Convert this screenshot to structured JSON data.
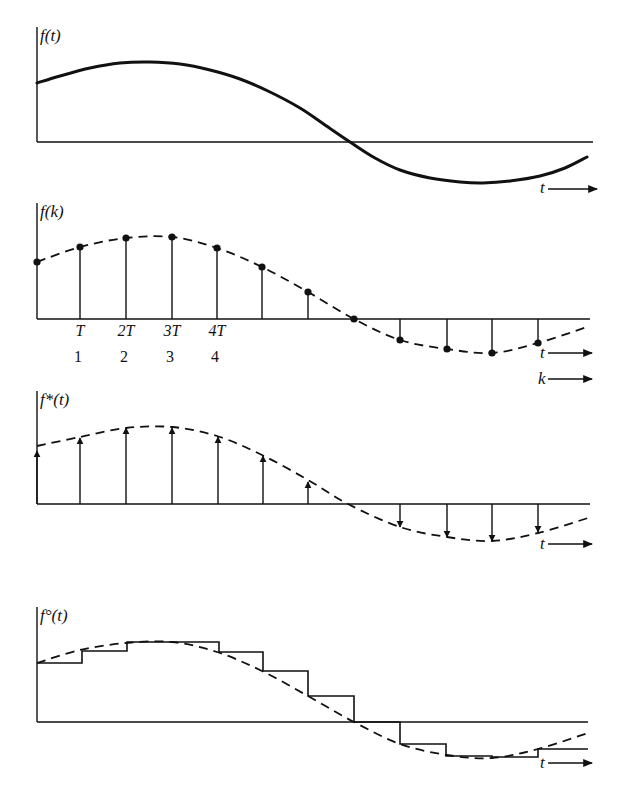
{
  "figure": {
    "ink_color": "#111111",
    "background": "#ffffff",
    "panels": [
      {
        "id": "continuous",
        "ylabel": "f(t)",
        "xlabel": "t",
        "curve_style": "solid",
        "axis": {
          "x0": 37,
          "top": 27,
          "baseline": 142,
          "x_end": 593
        },
        "curve_points": [
          [
            37,
            83
          ],
          [
            60,
            76
          ],
          [
            90,
            68
          ],
          [
            120,
            63
          ],
          [
            150,
            62
          ],
          [
            180,
            64
          ],
          [
            210,
            70
          ],
          [
            240,
            79
          ],
          [
            270,
            92
          ],
          [
            300,
            108
          ],
          [
            325,
            125
          ],
          [
            350,
            142
          ],
          [
            375,
            158
          ],
          [
            400,
            170
          ],
          [
            430,
            178
          ],
          [
            460,
            182
          ],
          [
            483,
            183
          ],
          [
            510,
            181
          ],
          [
            540,
            176
          ],
          [
            565,
            168
          ],
          [
            587,
            157
          ]
        ],
        "x_arrow": {
          "label_x": 540,
          "label_y": 193,
          "x1": 548,
          "x2": 597,
          "y": 189
        }
      },
      {
        "id": "discrete",
        "ylabel": "f(k)",
        "xlabel_t": "t",
        "xlabel_k": "k",
        "curve_style": "dashed",
        "axis": {
          "x0": 37,
          "top": 203,
          "baseline": 319,
          "x_end": 590
        },
        "samples": [
          [
            37,
            262
          ],
          [
            80,
            247
          ],
          [
            126,
            238
          ],
          [
            172,
            237
          ],
          [
            217,
            248
          ],
          [
            262,
            267
          ],
          [
            308,
            292
          ],
          [
            354,
            319
          ],
          [
            400,
            340
          ],
          [
            447,
            349
          ],
          [
            492,
            353
          ],
          [
            538,
            343
          ]
        ],
        "curve_end": [
          587,
          327
        ],
        "tick_labels_T": [
          "T",
          "2T",
          "3T",
          "4T"
        ],
        "tick_labels_k": [
          "1",
          "2",
          "3",
          "4"
        ],
        "tick_x": [
          80,
          126,
          172,
          217
        ],
        "tick_T_y": 336,
        "tick_k_y": 362,
        "t_arrow": {
          "label_x": 540,
          "label_y": 358,
          "x1": 548,
          "x2": 592,
          "y": 353
        },
        "k_arrow": {
          "label_x": 538,
          "label_y": 384,
          "x1": 548,
          "x2": 592,
          "y": 379
        }
      },
      {
        "id": "impulse",
        "ylabel": "f*(t)",
        "xlabel": "t",
        "curve_style": "dashed",
        "axis": {
          "x0": 37,
          "top": 391,
          "baseline": 504,
          "x_end": 590
        },
        "curve_points": [
          [
            37,
            446
          ],
          [
            80,
            437
          ],
          [
            126,
            428
          ],
          [
            172,
            427
          ],
          [
            217,
            436
          ],
          [
            262,
            455
          ],
          [
            308,
            480
          ],
          [
            348,
            504
          ],
          [
            400,
            527
          ],
          [
            447,
            537
          ],
          [
            492,
            541
          ],
          [
            538,
            533
          ],
          [
            588,
            518
          ]
        ],
        "impulses": [
          [
            37,
            451
          ],
          [
            80,
            438
          ],
          [
            126,
            428
          ],
          [
            172,
            428
          ],
          [
            218,
            437
          ],
          [
            263,
            456
          ],
          [
            308,
            482
          ],
          [
            400,
            527
          ],
          [
            447,
            537
          ],
          [
            492,
            541
          ],
          [
            538,
            532
          ]
        ],
        "x_arrow": {
          "label_x": 540,
          "label_y": 549,
          "x1": 548,
          "x2": 592,
          "y": 544
        }
      },
      {
        "id": "hold",
        "ylabel": "f°(t)",
        "xlabel": "t",
        "curve_style": "dashed",
        "axis": {
          "x0": 37,
          "top": 607,
          "baseline": 722,
          "x_end": 588
        },
        "curve_points": [
          [
            37,
            663
          ],
          [
            80,
            650
          ],
          [
            126,
            643
          ],
          [
            172,
            642
          ],
          [
            217,
            652
          ],
          [
            262,
            671
          ],
          [
            308,
            696
          ],
          [
            354,
            722
          ],
          [
            400,
            744
          ],
          [
            447,
            755
          ],
          [
            492,
            758
          ],
          [
            538,
            749
          ],
          [
            588,
            733
          ]
        ],
        "steps": [
          [
            37,
            663
          ],
          [
            82,
            663
          ],
          [
            82,
            651
          ],
          [
            127,
            651
          ],
          [
            127,
            642
          ],
          [
            219,
            642
          ],
          [
            219,
            652
          ],
          [
            263,
            652
          ],
          [
            263,
            671
          ],
          [
            308,
            671
          ],
          [
            308,
            696
          ],
          [
            354,
            696
          ],
          [
            354,
            722
          ],
          [
            400,
            722
          ],
          [
            400,
            744
          ],
          [
            446,
            744
          ],
          [
            446,
            756
          ],
          [
            492,
            756
          ],
          [
            492,
            757
          ],
          [
            538,
            757
          ],
          [
            538,
            749
          ],
          [
            588,
            749
          ]
        ],
        "x_arrow": {
          "label_x": 540,
          "label_y": 768,
          "x1": 548,
          "x2": 592,
          "y": 763
        }
      }
    ]
  }
}
